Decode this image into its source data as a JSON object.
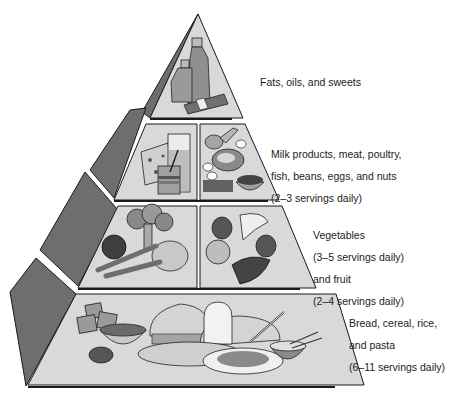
{
  "diagram": {
    "type": "food-guide-pyramid",
    "colors": {
      "face": "#d9d9d9",
      "side": "#6e6e6e",
      "outline": "#1a1a1a",
      "text": "#222222"
    },
    "tiers": [
      {
        "id": "fats",
        "lines": [
          "Fats, oils, and sweets"
        ],
        "items": [
          "oil-bottle",
          "vinegar-bottle",
          "jug",
          "candy-bar"
        ]
      },
      {
        "id": "milk-meat",
        "lines": [
          "Milk products, meat, poultry,",
          "fish, beans, eggs, and nuts",
          "(2–3 servings daily)"
        ],
        "items": [
          "cheese",
          "milk-glass",
          "yogurt-cup",
          "chicken-leg",
          "steak",
          "eggs",
          "beans",
          "nuts-bowl"
        ]
      },
      {
        "id": "vegetables-fruit",
        "lines": [
          "Vegetables",
          "(3–5 servings daily)",
          "and fruit",
          "(2–4 servings daily)"
        ],
        "items": [
          "broccoli",
          "tomato",
          "carrots",
          "lettuce",
          "apple",
          "orange",
          "banana",
          "grapes"
        ]
      },
      {
        "id": "grains",
        "lines": [
          "Bread, cereal, rice,",
          "and pasta",
          "(6–11 servings daily)"
        ],
        "items": [
          "crackers",
          "cereal-bowl",
          "bread-loaf",
          "bread-slice",
          "roll",
          "spaghetti-plate",
          "fork",
          "rice-bowl",
          "chopsticks"
        ]
      }
    ]
  }
}
